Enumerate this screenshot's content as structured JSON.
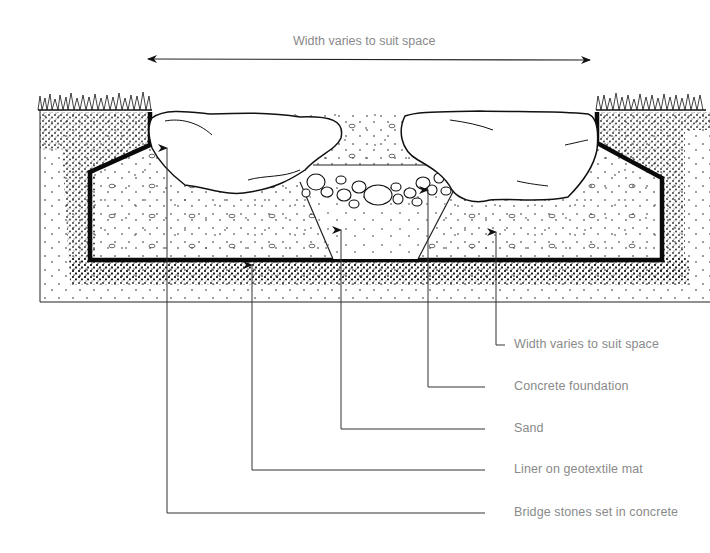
{
  "diagram": {
    "dimension": {
      "label": "Width varies to suit space",
      "arrow": "double-headed horizontal"
    },
    "callouts": [
      {
        "id": "width",
        "label": "Width varies to suit space"
      },
      {
        "id": "concrete-foundation",
        "label": "Concrete foundation"
      },
      {
        "id": "sand",
        "label": "Sand"
      },
      {
        "id": "liner",
        "label": "Liner on geotextile mat"
      },
      {
        "id": "bridge-stones",
        "label": "Bridge stones set in concrete"
      }
    ],
    "elements": {
      "ground": "grass-topped soil banks on both sides",
      "pebbles": "cobble pebbles over sand in central trench",
      "stones": "two large bridge stones"
    },
    "colors": {
      "ink": "#111111",
      "label_text": "#8a8a8a",
      "leader": "#333333",
      "background": "#ffffff"
    }
  }
}
